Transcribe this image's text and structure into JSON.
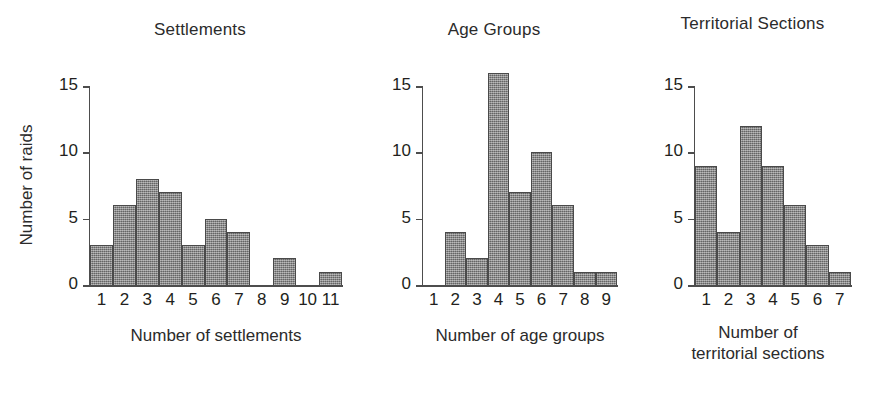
{
  "figure": {
    "ylabel": "Number of raids",
    "y_ticks": [
      "0",
      "5",
      "10",
      "15"
    ]
  },
  "chart_data": [
    {
      "type": "bar",
      "title": "Settlements",
      "xlabel": "Number of settlements",
      "ylabel": "Number of raids",
      "categories": [
        "1",
        "2",
        "3",
        "4",
        "5",
        "6",
        "7",
        "8",
        "9",
        "10",
        "11"
      ],
      "values": [
        3,
        6,
        8,
        7,
        3,
        5,
        4,
        0,
        2,
        0,
        1
      ],
      "ylim": [
        0,
        16
      ],
      "yticks": [
        0,
        5,
        10,
        15
      ],
      "grid": false,
      "legend": "none"
    },
    {
      "type": "bar",
      "title": "Age Groups",
      "xlabel": "Number of age groups",
      "ylabel": "Number of raids",
      "categories": [
        "1",
        "2",
        "3",
        "4",
        "5",
        "6",
        "7",
        "8",
        "9"
      ],
      "values": [
        0,
        4,
        2,
        16,
        7,
        10,
        6,
        1,
        1
      ],
      "ylim": [
        0,
        16
      ],
      "yticks": [
        0,
        5,
        10,
        15
      ],
      "grid": false,
      "legend": "none"
    },
    {
      "type": "bar",
      "title": "Territorial Sections",
      "xlabel": "Number of\nterritorial sections",
      "ylabel": "Number of raids",
      "categories": [
        "1",
        "2",
        "3",
        "4",
        "5",
        "6",
        "7"
      ],
      "values": [
        9,
        4,
        12,
        9,
        6,
        3,
        1
      ],
      "ylim": [
        0,
        16
      ],
      "yticks": [
        0,
        5,
        10,
        15
      ],
      "grid": false,
      "legend": "none"
    }
  ],
  "colors": {
    "bar_fill": "#808080",
    "bar_stroke": "#4a4a4a",
    "axis": "#4d4d4d",
    "text": "#231f20",
    "background": "#ffffff"
  }
}
